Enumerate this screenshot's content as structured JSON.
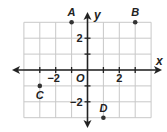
{
  "chart_data": {
    "type": "scatter",
    "title": "",
    "xlabel": "x",
    "ylabel": "y",
    "origin_label": "O",
    "xlim": [
      -4,
      4
    ],
    "ylim": [
      -3,
      3
    ],
    "grid": true,
    "x_ticks": [
      {
        "value": -2,
        "label": "−2"
      },
      {
        "value": 2,
        "label": "2"
      }
    ],
    "y_ticks": [
      {
        "value": 2,
        "label": "2"
      },
      {
        "value": -2,
        "label": "−2"
      }
    ],
    "points": [
      {
        "label": "A",
        "x": -1,
        "y": 3
      },
      {
        "label": "B",
        "x": 3,
        "y": 3
      },
      {
        "label": "C",
        "x": -3,
        "y": -1
      },
      {
        "label": "D",
        "x": 1,
        "y": -3
      }
    ]
  },
  "colors": {
    "grid": "#c8c8c8",
    "axis": "#222222",
    "point": "#333333"
  }
}
